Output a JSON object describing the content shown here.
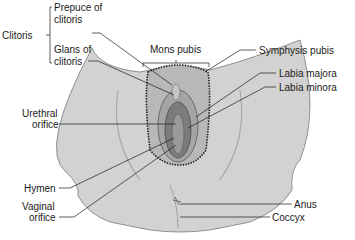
{
  "figure": {
    "type": "anatomical-diagram"
  },
  "labels": {
    "clitoris": "Clitoris",
    "prepuce_line1": "Prepuce of",
    "prepuce_line2": "clitoris",
    "glans_line1": "Glans of",
    "glans_line2": "clitoris",
    "mons_pubis": "Mons pubis",
    "symphysis_pubis": "Symphysis pubis",
    "labia_majora": "Labia majora",
    "labia_minora": "Labia minora",
    "urethral_line1": "Urethral",
    "urethral_line2": "orifice",
    "hymen": "Hymen",
    "vaginal_line1": "Vaginal",
    "vaginal_line2": "orifice",
    "anus": "Anus",
    "coccyx": "Coccyx"
  },
  "colors": {
    "skin": "#c9c9c9",
    "skin_light": "#dcdcdc",
    "labia": "#8a8a8a",
    "labia_dark": "#5e5e5e",
    "hair": "#2a2a2a",
    "leader_line": "#1a1a1a"
  }
}
